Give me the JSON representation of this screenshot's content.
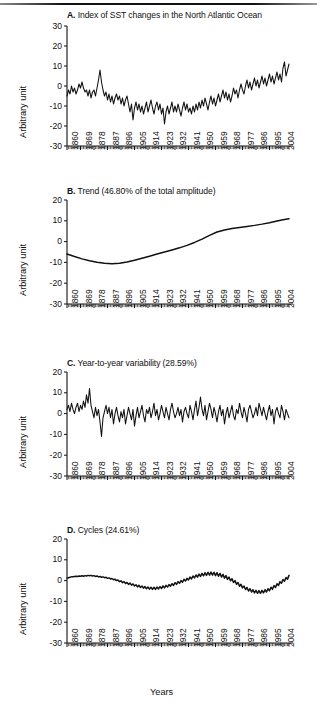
{
  "figure": {
    "xaxis_title": "Years",
    "ylabel": "Arbitrary unit"
  },
  "chart_data": [
    {
      "type": "line",
      "panel": "A",
      "title": "A. Index of SST changes in the North Atlantic Ocean",
      "title_letter": "A.",
      "title_text": "Index of SST changes in the North Atlantic Ocean",
      "xlabel": "Years",
      "ylabel": "Arbitrary unit",
      "ylim": [
        -30,
        30
      ],
      "yticks": [
        30,
        20,
        10,
        0,
        -10,
        -20,
        -30
      ],
      "xlim": [
        1860,
        2008
      ],
      "xticks": [
        1860,
        1869,
        1878,
        1887,
        1896,
        1905,
        1914,
        1923,
        1932,
        1941,
        1950,
        1959,
        1968,
        1977,
        1986,
        1995,
        2004
      ],
      "grid": false,
      "legend": "none",
      "x": [
        1860,
        1861,
        1862,
        1863,
        1864,
        1865,
        1866,
        1867,
        1868,
        1869,
        1870,
        1871,
        1872,
        1873,
        1874,
        1875,
        1876,
        1877,
        1878,
        1879,
        1880,
        1881,
        1882,
        1883,
        1884,
        1885,
        1886,
        1887,
        1888,
        1889,
        1890,
        1891,
        1892,
        1893,
        1894,
        1895,
        1896,
        1897,
        1898,
        1899,
        1900,
        1901,
        1902,
        1903,
        1904,
        1905,
        1906,
        1907,
        1908,
        1909,
        1910,
        1911,
        1912,
        1913,
        1914,
        1915,
        1916,
        1917,
        1918,
        1919,
        1920,
        1921,
        1922,
        1923,
        1924,
        1925,
        1926,
        1927,
        1928,
        1929,
        1930,
        1931,
        1932,
        1933,
        1934,
        1935,
        1936,
        1937,
        1938,
        1939,
        1940,
        1941,
        1942,
        1943,
        1944,
        1945,
        1946,
        1947,
        1948,
        1949,
        1950,
        1951,
        1952,
        1953,
        1954,
        1955,
        1956,
        1957,
        1958,
        1959,
        1960,
        1961,
        1962,
        1963,
        1964,
        1965,
        1966,
        1967,
        1968,
        1969,
        1970,
        1971,
        1972,
        1973,
        1974,
        1975,
        1976,
        1977,
        1978,
        1979,
        1980,
        1981,
        1982,
        1983,
        1984,
        1985,
        1986,
        1987,
        1988,
        1989,
        1990,
        1991,
        1992,
        1993,
        1994,
        1995,
        1996,
        1997,
        1998,
        1999,
        2000,
        2001,
        2002,
        2003,
        2004,
        2005,
        2006,
        2007,
        2008
      ],
      "values": [
        -5,
        -2,
        -4,
        0,
        -3,
        -1,
        -4,
        -2,
        1,
        -1,
        2,
        -1,
        -3,
        -2,
        -5,
        -2,
        -6,
        -3,
        -2,
        -5,
        -1,
        3,
        8,
        2,
        -2,
        -5,
        -3,
        -7,
        -4,
        -8,
        -5,
        -9,
        -6,
        -4,
        -7,
        -5,
        -9,
        -6,
        -10,
        -7,
        -5,
        -9,
        -13,
        -9,
        -17,
        -11,
        -8,
        -12,
        -9,
        -13,
        -10,
        -14,
        -11,
        -8,
        -13,
        -10,
        -7,
        -11,
        -14,
        -10,
        -8,
        -12,
        -9,
        -14,
        -11,
        -19,
        -13,
        -10,
        -14,
        -11,
        -8,
        -13,
        -10,
        -13,
        -9,
        -12,
        -15,
        -11,
        -8,
        -12,
        -9,
        -13,
        -11,
        -14,
        -10,
        -13,
        -9,
        -12,
        -8,
        -11,
        -7,
        -10,
        -6,
        -9,
        -12,
        -8,
        -5,
        -9,
        -6,
        -10,
        -7,
        -4,
        -8,
        -5,
        -2,
        -6,
        -3,
        -7,
        -4,
        -8,
        -5,
        -1,
        -4,
        -2,
        -6,
        -2,
        1,
        -2,
        -4,
        0,
        3,
        -1,
        2,
        -2,
        1,
        4,
        0,
        3,
        -1,
        2,
        5,
        1,
        4,
        0,
        3,
        6,
        2,
        5,
        1,
        4,
        7,
        3,
        6,
        2,
        9,
        12,
        5,
        8,
        11,
        4,
        2,
        5,
        8,
        3,
        6,
        9,
        4,
        7,
        2,
        5,
        8,
        10,
        6,
        3,
        7,
        10,
        13,
        8,
        5,
        9,
        12,
        6,
        10,
        13,
        7,
        4,
        8,
        11,
        14,
        9,
        5,
        8,
        11,
        6,
        3,
        7,
        10,
        5,
        8,
        4,
        7,
        3,
        6,
        9,
        5,
        2,
        6,
        9,
        4,
        7,
        3,
        6,
        9,
        5,
        8,
        11,
        6,
        3,
        7,
        10,
        5,
        8,
        12,
        7,
        4,
        8,
        11,
        6,
        9,
        13,
        7,
        10,
        14,
        8,
        5,
        9,
        12,
        15,
        10,
        7,
        11,
        14,
        9,
        12,
        16,
        11,
        8,
        12,
        15,
        18,
        13,
        10,
        14,
        17,
        12,
        9,
        13,
        16,
        11,
        15,
        18,
        13,
        10,
        14,
        17,
        12,
        16,
        19,
        14,
        11,
        15,
        18,
        13,
        16,
        15,
        17,
        14,
        16,
        15
      ]
    },
    {
      "type": "line",
      "panel": "B",
      "title": "B. Trend (46.80% of the total amplitude)",
      "title_letter": "B.",
      "title_text": "Trend (46.80% of the total amplitude)",
      "percent": "46.80%",
      "xlabel": "Years",
      "ylabel": "Arbitrary unit",
      "ylim": [
        -30,
        20
      ],
      "yticks": [
        20,
        10,
        0,
        -10,
        -20,
        -30
      ],
      "xlim": [
        1860,
        2008
      ],
      "xticks": [
        1860,
        1869,
        1878,
        1887,
        1896,
        1905,
        1914,
        1923,
        1932,
        1941,
        1950,
        1959,
        1968,
        1977,
        1986,
        1995,
        2004
      ],
      "grid": false,
      "legend": "none",
      "x": [
        1860,
        1865,
        1870,
        1875,
        1880,
        1885,
        1890,
        1895,
        1900,
        1905,
        1910,
        1915,
        1920,
        1925,
        1930,
        1935,
        1940,
        1945,
        1950,
        1955,
        1960,
        1965,
        1970,
        1975,
        1980,
        1985,
        1990,
        1995,
        2000,
        2004,
        2008
      ],
      "values": [
        -6.0,
        -7.2,
        -8.3,
        -9.2,
        -9.9,
        -10.4,
        -10.6,
        -10.4,
        -9.8,
        -9.0,
        -8.0,
        -7.0,
        -6.0,
        -5.0,
        -4.0,
        -3.0,
        -1.8,
        -0.4,
        1.2,
        3.0,
        4.6,
        5.6,
        6.3,
        6.8,
        7.3,
        7.8,
        8.4,
        9.1,
        9.9,
        10.5,
        11.0
      ]
    },
    {
      "type": "line",
      "panel": "C",
      "title": "C. Year-to-year variability (28.59%)",
      "title_letter": "C.",
      "title_text": "Year-to-year variability (28.59%)",
      "percent": "28.59%",
      "xlabel": "Years",
      "ylabel": "Arbitrary unit",
      "ylim": [
        -30,
        20
      ],
      "yticks": [
        20,
        10,
        0,
        -10,
        -20,
        -30
      ],
      "xlim": [
        1860,
        2008
      ],
      "xticks": [
        1860,
        1869,
        1878,
        1887,
        1896,
        1905,
        1914,
        1923,
        1932,
        1941,
        1950,
        1959,
        1968,
        1977,
        1986,
        1995,
        2004
      ],
      "grid": false,
      "legend": "none",
      "x": [
        1860,
        1861,
        1862,
        1863,
        1864,
        1865,
        1866,
        1867,
        1868,
        1869,
        1870,
        1871,
        1872,
        1873,
        1874,
        1875,
        1876,
        1877,
        1878,
        1879,
        1880,
        1881,
        1882,
        1883,
        1884,
        1885,
        1886,
        1887,
        1888,
        1889,
        1890,
        1891,
        1892,
        1893,
        1894,
        1895,
        1896,
        1897,
        1898,
        1899,
        1900,
        1901,
        1902,
        1903,
        1904,
        1905,
        1906,
        1907,
        1908,
        1909,
        1910,
        1911,
        1912,
        1913,
        1914,
        1915,
        1916,
        1917,
        1918,
        1919,
        1920,
        1921,
        1922,
        1923,
        1924,
        1925,
        1926,
        1927,
        1928,
        1929,
        1930,
        1931,
        1932,
        1933,
        1934,
        1935,
        1936,
        1937,
        1938,
        1939,
        1940,
        1941,
        1942,
        1943,
        1944,
        1945,
        1946,
        1947,
        1948,
        1949,
        1950,
        1951,
        1952,
        1953,
        1954,
        1955,
        1956,
        1957,
        1958,
        1959,
        1960,
        1961,
        1962,
        1963,
        1964,
        1965,
        1966,
        1967,
        1968,
        1969,
        1970,
        1971,
        1972,
        1973,
        1974,
        1975,
        1976,
        1977,
        1978,
        1979,
        1980,
        1981,
        1982,
        1983,
        1984,
        1985,
        1986,
        1987,
        1988,
        1989,
        1990,
        1991,
        1992,
        1993,
        1994,
        1995,
        1996,
        1997,
        1998,
        1999,
        2000,
        2001,
        2002,
        2003,
        2004,
        2005,
        2006,
        2007,
        2008
      ],
      "values": [
        2,
        4,
        1,
        5,
        2,
        0,
        3,
        5,
        1,
        4,
        2,
        6,
        3,
        9,
        5,
        12,
        4,
        1,
        -2,
        3,
        -1,
        2,
        -4,
        -11,
        -2,
        1,
        4,
        0,
        3,
        -2,
        2,
        -5,
        0,
        3,
        -1,
        -4,
        1,
        -2,
        2,
        -5,
        -1,
        3,
        0,
        -3,
        2,
        -6,
        -1,
        3,
        -2,
        1,
        4,
        -1,
        -4,
        2,
        0,
        3,
        -2,
        1,
        5,
        -1,
        2,
        -3,
        0,
        4,
        1,
        -2,
        3,
        0,
        -3,
        2,
        5,
        1,
        -2,
        0,
        3,
        -1,
        2,
        -4,
        1,
        3,
        0,
        -2,
        4,
        1,
        -3,
        2,
        6,
        -1,
        3,
        8,
        2,
        -1,
        4,
        -3,
        1,
        5,
        2,
        -2,
        3,
        0,
        -4,
        1,
        4,
        -1,
        2,
        -5,
        0,
        3,
        -2,
        1,
        4,
        -1,
        -3,
        2,
        0,
        5,
        1,
        -2,
        3,
        0,
        -4,
        2,
        4,
        1,
        -2,
        0,
        3,
        -1,
        5,
        2,
        -1,
        3,
        0,
        -3,
        1,
        4,
        -1,
        2,
        -5,
        1,
        3,
        0,
        -2,
        4,
        1,
        -3,
        2,
        0,
        -2
      ]
    },
    {
      "type": "line",
      "panel": "D",
      "title": "D. Cycles (24.61%)",
      "title_letter": "D.",
      "title_text": "Cycles (24.61%)",
      "percent": "24.61%",
      "xlabel": "Years",
      "ylabel": "Arbitrary unit",
      "ylim": [
        -30,
        20
      ],
      "yticks": [
        20,
        10,
        0,
        -10,
        -20,
        -30
      ],
      "xlim": [
        1860,
        2008
      ],
      "xticks": [
        1860,
        1869,
        1878,
        1887,
        1896,
        1905,
        1914,
        1923,
        1932,
        1941,
        1950,
        1959,
        1968,
        1977,
        1986,
        1995,
        2004
      ],
      "grid": false,
      "legend": "none",
      "description": "Quasi-decadal oscillation with multidecadal envelope",
      "x": [
        1860,
        1861,
        1862,
        1863,
        1864,
        1865,
        1866,
        1867,
        1868,
        1869,
        1870,
        1871,
        1872,
        1873,
        1874,
        1875,
        1876,
        1877,
        1878,
        1879,
        1880,
        1881,
        1882,
        1883,
        1884,
        1885,
        1886,
        1887,
        1888,
        1889,
        1890,
        1891,
        1892,
        1893,
        1894,
        1895,
        1896,
        1897,
        1898,
        1899,
        1900,
        1901,
        1902,
        1903,
        1904,
        1905,
        1906,
        1907,
        1908,
        1909,
        1910,
        1911,
        1912,
        1913,
        1914,
        1915,
        1916,
        1917,
        1918,
        1919,
        1920,
        1921,
        1922,
        1923,
        1924,
        1925,
        1926,
        1927,
        1928,
        1929,
        1930,
        1931,
        1932,
        1933,
        1934,
        1935,
        1936,
        1937,
        1938,
        1939,
        1940,
        1941,
        1942,
        1943,
        1944,
        1945,
        1946,
        1947,
        1948,
        1949,
        1950,
        1951,
        1952,
        1953,
        1954,
        1955,
        1956,
        1957,
        1958,
        1959,
        1960,
        1961,
        1962,
        1963,
        1964,
        1965,
        1966,
        1967,
        1968,
        1969,
        1970,
        1971,
        1972,
        1973,
        1974,
        1975,
        1976,
        1977,
        1978,
        1979,
        1980,
        1981,
        1982,
        1983,
        1984,
        1985,
        1986,
        1987,
        1988,
        1989,
        1990,
        1991,
        1992,
        1993,
        1994,
        1995,
        1996,
        1997,
        1998,
        1999,
        2000,
        2001,
        2002,
        2003,
        2004,
        2005,
        2006,
        2007,
        2008
      ],
      "values": [
        1.2,
        1.4,
        1.6,
        1.8,
        1.9,
        2.0,
        2.1,
        2.0,
        2.2,
        2.1,
        2.3,
        2.1,
        2.4,
        2.2,
        2.5,
        2.3,
        2.5,
        2.2,
        2.4,
        2.0,
        2.2,
        1.8,
        2.0,
        1.6,
        1.8,
        1.4,
        1.6,
        1.1,
        1.3,
        0.8,
        1.0,
        0.4,
        0.7,
        0.0,
        0.3,
        -0.5,
        -0.1,
        -1.0,
        -0.5,
        -1.4,
        -0.9,
        -1.8,
        -1.2,
        -2.2,
        -1.6,
        -2.6,
        -2.0,
        -3.0,
        -2.3,
        -3.3,
        -2.6,
        -3.6,
        -2.9,
        -3.9,
        -3.1,
        -4.1,
        -3.2,
        -4.2,
        -3.2,
        -4.2,
        -3.1,
        -4.0,
        -2.9,
        -3.8,
        -2.6,
        -3.5,
        -2.3,
        -3.1,
        -1.9,
        -2.7,
        -1.5,
        -2.3,
        -1.0,
        -1.8,
        -0.5,
        -1.3,
        0.0,
        -0.8,
        0.6,
        -0.2,
        1.1,
        0.3,
        1.7,
        0.8,
        2.2,
        1.3,
        2.7,
        1.7,
        3.1,
        2.0,
        3.5,
        2.3,
        3.8,
        2.5,
        4.0,
        2.6,
        4.1,
        2.6,
        4.0,
        2.4,
        3.8,
        2.1,
        3.5,
        1.7,
        3.0,
        1.2,
        2.4,
        0.6,
        1.7,
        -0.1,
        0.9,
        -0.9,
        0.0,
        -1.8,
        -0.9,
        -2.7,
        -1.8,
        -3.5,
        -2.6,
        -4.3,
        -3.3,
        -5.0,
        -3.9,
        -5.5,
        -4.4,
        -5.9,
        -4.7,
        -6.1,
        -4.8,
        -6.1,
        -4.7,
        -5.9,
        -4.4,
        -5.5,
        -3.9,
        -4.9,
        -3.2,
        -4.2,
        -2.4,
        -3.3,
        -1.5,
        -2.3,
        -0.5,
        -1.3,
        0.5,
        -0.3,
        1.5,
        0.7,
        2.5,
        1.7,
        3.4,
        2.6,
        4.3,
        3.5,
        5.2,
        4.4,
        6.0
      ]
    }
  ]
}
